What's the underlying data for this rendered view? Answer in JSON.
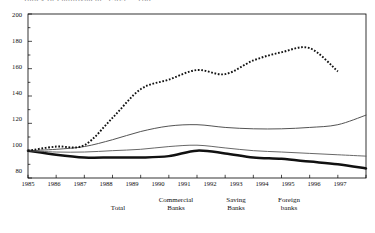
{
  "title_fragment": "Index of employment, 1985 = 100",
  "axes": {
    "y_ticks": [
      "200",
      "180",
      "160",
      "140",
      "120",
      "100",
      "80"
    ],
    "y_min": 80,
    "y_max": 200,
    "y_minor_step": 10,
    "x_ticks": [
      "1985",
      "1986",
      "1987",
      "1988",
      "1989",
      "1990",
      "1991",
      "1992",
      "1993",
      "1994",
      "1995",
      "1996",
      "1997"
    ],
    "x_min": 1985,
    "x_max": 1997,
    "grid": false,
    "frame": true
  },
  "legend": {
    "position": "bottom",
    "items": [
      {
        "label_line1": "Total",
        "label_line2": "",
        "style": "thin-solid"
      },
      {
        "label_line1": "Commercial",
        "label_line2": "Banks",
        "style": "thick-solid"
      },
      {
        "label_line1": "Saving",
        "label_line2": "Banks",
        "style": "thin-solid-light"
      },
      {
        "label_line1": "Foreign",
        "label_line2": "banks",
        "style": "dotted"
      }
    ]
  },
  "colors": {
    "line": "#1a1a1a",
    "light_line": "#555555",
    "frame": "#000000",
    "background": "#ffffff"
  },
  "chart_data": {
    "type": "line",
    "title": "Index of employment, 1985 = 100",
    "xlabel": "",
    "ylabel": "",
    "xlim": [
      1985,
      1997
    ],
    "ylim": [
      80,
      200
    ],
    "grid": false,
    "legend_position": "bottom",
    "x": [
      1985,
      1986,
      1987,
      1988,
      1989,
      1990,
      1991,
      1992,
      1993,
      1994,
      1995,
      1996,
      1997
    ],
    "series": [
      {
        "name": "Total",
        "style": "thin-solid",
        "values": [
          100,
          101,
          103,
          108,
          114,
          118,
          119,
          117,
          116,
          116,
          117,
          119,
          126
        ]
      },
      {
        "name": "Commercial Banks",
        "style": "thick-solid",
        "values": [
          100,
          97,
          95,
          95,
          95,
          96,
          100,
          98,
          95,
          94,
          92,
          90,
          87
        ]
      },
      {
        "name": "Saving Banks",
        "style": "thin-solid-light",
        "values": [
          100,
          99,
          99,
          100,
          101,
          103,
          104,
          102,
          100,
          99,
          98,
          97,
          96
        ]
      },
      {
        "name": "Foreign banks",
        "style": "dotted",
        "values": [
          100,
          103,
          104,
          124,
          145,
          152,
          159,
          156,
          166,
          172,
          175,
          158,
          null
        ]
      }
    ]
  }
}
